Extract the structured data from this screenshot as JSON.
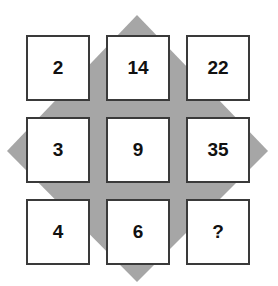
{
  "colors": {
    "diamond": "#a6a6a6",
    "box_border": "#3a3a3a",
    "box_fill": "#ffffff",
    "text": "#111111"
  },
  "grid": {
    "rows": [
      [
        "2",
        "14",
        "22"
      ],
      [
        "3",
        "9",
        "35"
      ],
      [
        "4",
        "6",
        "?"
      ]
    ]
  },
  "cells": [
    {
      "value": "2"
    },
    {
      "value": "14"
    },
    {
      "value": "22"
    },
    {
      "value": "3"
    },
    {
      "value": "9"
    },
    {
      "value": "35"
    },
    {
      "value": "4"
    },
    {
      "value": "6"
    },
    {
      "value": "?"
    }
  ]
}
